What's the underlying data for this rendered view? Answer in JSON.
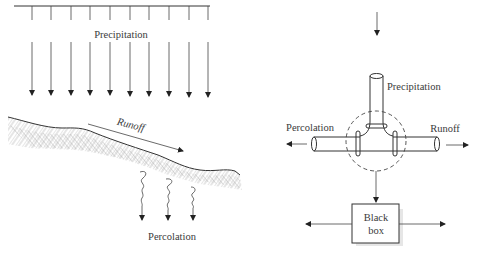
{
  "left_panel": {
    "precipitation_label": "Precipitation",
    "runoff_label": "Runoff",
    "percolation_label": "Percolation",
    "rain_arrow_count": 10
  },
  "right_panel": {
    "precipitation_label": "Precipitation",
    "percolation_label": "Percolation",
    "runoff_label": "Runoff",
    "box_label_line1": "Black",
    "box_label_line2": "box"
  },
  "colors": {
    "line": "#333333",
    "text": "#3a3a3a",
    "hatch": "#9a9a9a",
    "background": "#ffffff"
  }
}
